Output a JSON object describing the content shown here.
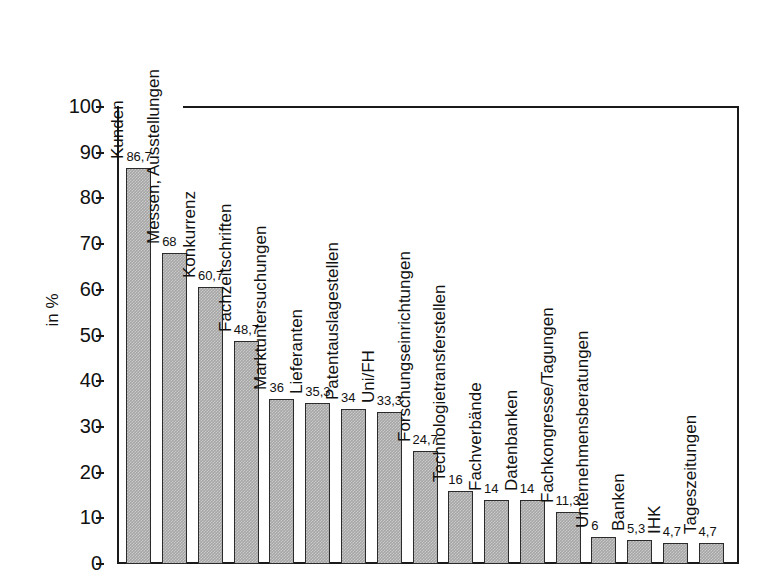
{
  "chart_data": {
    "type": "bar",
    "title": "",
    "subtitle": "",
    "xlabel": "",
    "ylabel": "in %",
    "ylim": [
      0,
      100
    ],
    "yticks": [
      0,
      10,
      20,
      30,
      40,
      50,
      60,
      70,
      80,
      90,
      100
    ],
    "ytick_labels": [
      "0",
      "10",
      "20",
      "30",
      "40",
      "50",
      "60",
      "70",
      "80",
      "90",
      "100"
    ],
    "grid": false,
    "legend": false,
    "decimal_separator": ",",
    "bar_color": "#a6a6a6",
    "bar_edge_color": "#2b2b2b",
    "axis_color": "#1a1a1a",
    "categories": [
      "Kunden",
      "Messen, Ausstellungen",
      "Konkurrenz",
      "Fachzeitschriften",
      "Marktuntersuchungen",
      "Lieferanten",
      "Patentauslagestellen",
      "Uni/FH",
      "Forschungseinrichtungen",
      "Technologietransferstellen",
      "Fachverbände",
      "Datenbanken",
      "Fachkongresse/Tagungen",
      "Unternehmensberatungen",
      "Banken",
      "IHK",
      "Tageszeitungen"
    ],
    "values": [
      86.7,
      68,
      60.7,
      48.7,
      36,
      35.3,
      34,
      33.3,
      24.7,
      16,
      14,
      14,
      11.3,
      6,
      5.3,
      4.7,
      4.7
    ],
    "value_labels": [
      "86,7",
      "68",
      "60,7",
      "48,7",
      "36",
      "35,3",
      "34",
      "33,3",
      "24,7",
      "16",
      "14",
      "14",
      "11,3",
      "6",
      "5,3",
      "4,7",
      "4,7"
    ]
  }
}
